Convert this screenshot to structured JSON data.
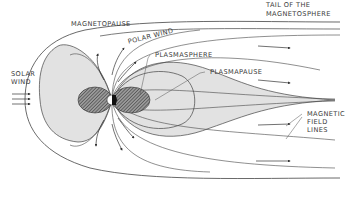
{
  "diagram": {
    "labels": {
      "magnetopause": "MAGNETOPAUSE",
      "tail_line1": "TAIL OF THE",
      "tail_line2": "MAGNETOSPHERE",
      "polar_wind": "POLAR WIND",
      "plasmasphere": "PLASMASPHERE",
      "plasmapause": "PLASMAPAUSE",
      "solar_line1": "SOLAR",
      "solar_line2": "WIND",
      "magnetic_line1": "MAGNETIC",
      "magnetic_line2": "FIELD",
      "magnetic_line3": "LINES"
    },
    "colors": {
      "line": "#3c3c3c",
      "shade": "#e0e0e0",
      "hatch": "#6a6a6a",
      "earth_dark": "#111111",
      "background": "#ffffff"
    }
  }
}
